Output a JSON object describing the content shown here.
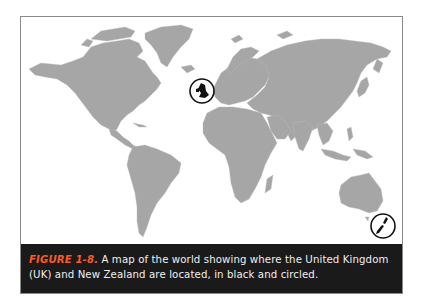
{
  "figure": {
    "label": "FIGURE 1-8.",
    "caption": " A map of the world showing where the United Kingdom (UK) and New Zealand are located, in black and circled."
  },
  "map": {
    "type": "world-political-outline",
    "land_color": "#a6a6a6",
    "ocean_color": "#ffffff",
    "highlight_color": "#111111",
    "highlighted_regions": [
      {
        "name": "United Kingdom",
        "marker": "circle"
      },
      {
        "name": "New Zealand",
        "marker": "circle"
      }
    ]
  },
  "colors": {
    "caption_background": "#1a1a1a",
    "caption_text": "#f0f0f0",
    "caption_label": "#ff5a1f",
    "frame_border": "#8a8a8a"
  }
}
